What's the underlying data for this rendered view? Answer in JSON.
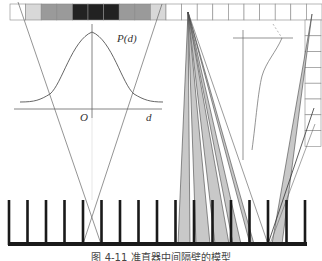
{
  "figure": {
    "labels": {
      "pd": "P(d)",
      "origin": "O",
      "d_axis": "d"
    },
    "caption": "图 4-11  准直器中间隔壁的模型",
    "detector_strip": {
      "cell_fills": [
        "#ffffff",
        "#d8d8d8",
        "#9a9a9a",
        "#9a9a9a",
        "#222222",
        "#222222",
        "#222222",
        "#9a9a9a",
        "#9a9a9a",
        "#d8d8d8",
        "#ffffff",
        "#ffffff",
        "#ffffff",
        "#ffffff",
        "#ffffff",
        "#ffffff",
        "#ffffff",
        "#ffffff",
        "#ffffff",
        "#ffffff"
      ]
    },
    "right_column_cells": 8,
    "septa_count": 17,
    "colors": {
      "line": "#555555",
      "septa": "#1a1a1a",
      "penumbra_fill": "#c8c8c8",
      "grid": "#888888"
    }
  }
}
